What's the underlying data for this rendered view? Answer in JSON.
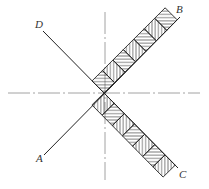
{
  "diagram": {
    "type": "engineering-drawing",
    "center": {
      "x": 104,
      "y": 93
    },
    "labels": {
      "A": "A",
      "B": "B",
      "C": "C",
      "D": "D"
    },
    "label_positions": {
      "A": {
        "x": 36,
        "y": 162
      },
      "B": {
        "x": 176,
        "y": 13
      },
      "C": {
        "x": 179,
        "y": 178
      },
      "D": {
        "x": 35,
        "y": 28
      }
    },
    "lines": {
      "AB": {
        "x1": 44,
        "y1": 155,
        "x2": 180,
        "y2": 17
      },
      "DC": {
        "x1": 43,
        "y1": 31,
        "x2": 178,
        "y2": 168
      }
    },
    "centerlines": {
      "horizontal": {
        "x1": 8,
        "y1": 93,
        "x2": 200,
        "y2": 93
      },
      "vertical": {
        "x1": 105,
        "y1": 10,
        "x2": 105,
        "y2": 180
      }
    },
    "band": {
      "width": 17,
      "cells_per_arm": 7,
      "hatch_patterns": [
        "vertical",
        "horizontal"
      ]
    },
    "colors": {
      "line": "#222222",
      "centerline": "#888888",
      "hatch": "#333333",
      "background": "#ffffff"
    }
  }
}
